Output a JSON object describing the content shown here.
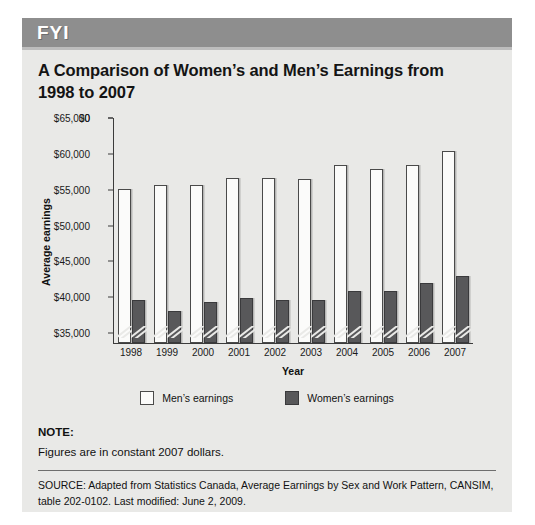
{
  "banner": {
    "label": "FYI"
  },
  "figure": {
    "title": "A Comparison of Women’s and Men’s Earnings from 1998 to 2007"
  },
  "note": {
    "heading": "NOTE:",
    "body": "Figures are in constant 2007 dollars."
  },
  "source": {
    "text": "SOURCE: Adapted from Statistics Canada, Average Earnings by Sex and Work Pattern, CANSIM, table 202-0102. Last modified: June 2, 2009."
  },
  "colors": {
    "banner_gray": "#8e8e8e",
    "panel_bg": "#e9e9e7",
    "men_bar": "#fbfbfa",
    "women_bar": "#58585a",
    "axis": "#3b3b3b"
  },
  "chart_data": {
    "type": "bar",
    "title": "A Comparison of Women’s and Men’s Earnings from 1998 to 2007",
    "xlabel": "Year",
    "ylabel": "Average earnings",
    "categories": [
      "1998",
      "1999",
      "2000",
      "2001",
      "2002",
      "2003",
      "2004",
      "2005",
      "2006",
      "2007"
    ],
    "series": [
      {
        "name": "Men’s earnings",
        "color": "#fbfbfa",
        "values": [
          55000,
          55500,
          55500,
          56500,
          56500,
          56300,
          58300,
          57700,
          58300,
          60300
        ]
      },
      {
        "name": "Women’s earnings",
        "color": "#58585a",
        "values": [
          39500,
          38000,
          39200,
          39800,
          39500,
          39500,
          40800,
          40800,
          41900,
          42900
        ]
      }
    ],
    "ylim": [
      33500,
      65000
    ],
    "ytick_labels": [
      "$65,000",
      "$60,000",
      "$55,000",
      "$50,000",
      "$45,000",
      "$40,000",
      "$35,000",
      "$0"
    ],
    "ytick_values": [
      65000,
      60000,
      55000,
      50000,
      45000,
      40000,
      35000,
      0
    ],
    "axis_break": true,
    "grid": false,
    "legend_position": "bottom"
  }
}
